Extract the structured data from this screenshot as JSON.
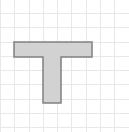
{
  "canvas": {
    "width": 129,
    "height": 132,
    "background_color": "#ffffff",
    "label": "grid-canvas"
  },
  "grid": {
    "label": "graph-paper-grid",
    "cell_size": 14.3,
    "line_color": "#e8e8e8",
    "line_width": 1,
    "vertical_lines": [
      0.4,
      14.7,
      29.0,
      43.3,
      57.6,
      71.9,
      86.2,
      100.5,
      114.8
    ],
    "horizontal_lines": [
      13.4,
      27.7,
      42.0,
      56.3,
      70.6,
      84.9,
      99.2,
      113.5,
      127.8
    ]
  },
  "chart_data": {
    "type": "polygon-diagram",
    "title": "",
    "shape_name": "T-shape",
    "fill_color": "#d2d2d2",
    "stroke_color": "#808080",
    "stroke_width": 1.5,
    "points": [
      [
        14,
        42
      ],
      [
        92,
        42
      ],
      [
        92,
        57
      ],
      [
        61,
        57
      ],
      [
        61,
        103
      ],
      [
        43,
        103
      ],
      [
        43,
        57
      ],
      [
        14,
        57
      ]
    ],
    "bar": {
      "x": 14,
      "y": 42,
      "width": 78,
      "height": 15
    },
    "stem": {
      "x": 43,
      "y": 57,
      "width": 18,
      "height": 46
    },
    "grid_units": {
      "bar_width_cells": 5.5,
      "bar_height_cells": 1,
      "stem_width_cells": 1.25,
      "stem_height_cells": 3.25
    }
  }
}
